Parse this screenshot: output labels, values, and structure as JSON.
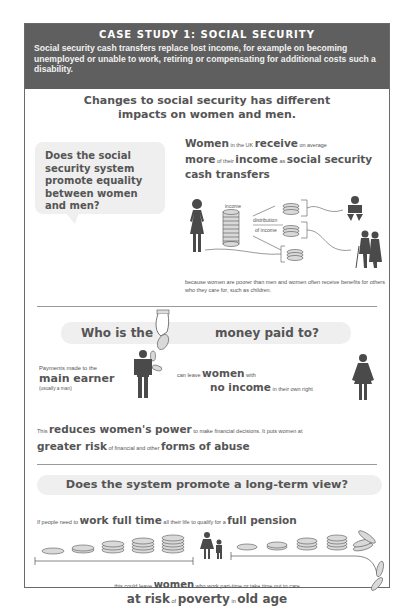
{
  "header": {
    "title": "CASE STUDY 1: SOCIAL SECURITY",
    "description": "Social security cash transfers replace lost income, for example on becoming unemployed or unable to work, retiring or compensating for additional costs such a disability."
  },
  "section1": {
    "title_line1": "Changes to social security has different",
    "title_line2": "impacts on women and men.",
    "question": "Does the social security system promote equality between women and men?",
    "claim": {
      "w1": "Women",
      "s1": " in the UK ",
      "w2": "receive",
      "s2": " on average",
      "w3": "more",
      "s3": " of their ",
      "w4": "income",
      "s4": " as ",
      "w5": "social security cash transfers"
    },
    "diagram": {
      "income_label": "income",
      "distribution_label_1": "distribution",
      "distribution_label_2": "of income",
      "icons": [
        "woman-icon",
        "coin-stack-icon",
        "baby-icon",
        "elderly-couple-icon"
      ]
    },
    "caption": "because women are poorer than men and women often receive benefits for others who they care for, such as children."
  },
  "section2": {
    "title_part1": "Who is the",
    "title_part2": "money paid to?",
    "payments_text": "Payments made to the",
    "main_earner": "main earner",
    "main_earner_note": "(usually a man)",
    "leave_text": "can leave ",
    "women": "women",
    "with": " with",
    "no_income": "no income",
    "own_right": " in their own right",
    "reduces": {
      "s1": "This ",
      "w1": "reduces women's power",
      "s2": " to make financial decisions. It puts women at",
      "w2": "greater risk",
      "s3": " of financial and other ",
      "w3": "forms of abuse"
    }
  },
  "section3": {
    "title": "Does the system promote a long-term view?",
    "work": {
      "s1": "If people need to ",
      "w1": "work full time",
      "s2": " all their life to qualify for a ",
      "w2": "full pension"
    },
    "leave": {
      "s1": "this could leave ",
      "w1": "women",
      "s2": " who work part-time or take time out to care"
    },
    "risk": {
      "w1": "at risk",
      "s1": " of ",
      "w2": "poverty",
      "s2": " in ",
      "w3": "old age"
    }
  },
  "colors": {
    "header_bg": "#5f5f5f",
    "text_dark": "#555555",
    "bubble_bg": "#efefef",
    "icon": "#4a4a4a",
    "coin_fill": "#d9d9d9"
  }
}
